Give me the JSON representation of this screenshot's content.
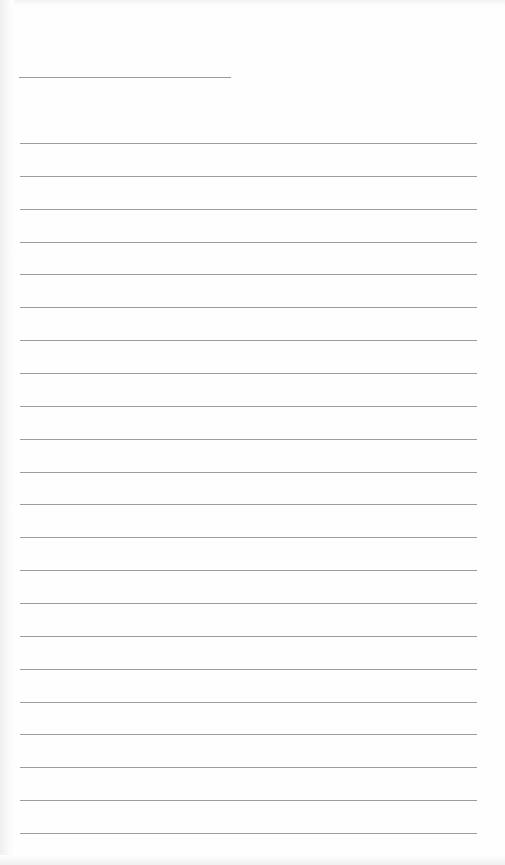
{
  "document": {
    "type": "lined-paper-form",
    "background_color": "#fefefe",
    "rule_color": "#9c9c9c",
    "header_rule": {
      "x": 19,
      "y": 77,
      "width": 212
    },
    "body_rules": {
      "x": 20,
      "width": 457,
      "start_y": 143,
      "spacing": 32.86,
      "count": 22
    }
  }
}
